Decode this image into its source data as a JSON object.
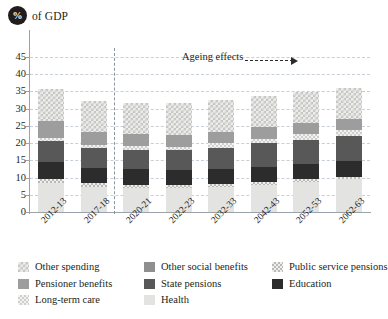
{
  "header": {
    "badge": "%",
    "label": "of GDP"
  },
  "annotation": {
    "ageing_effects": "Ageing effects"
  },
  "legend": {
    "items": [
      {
        "label": "Other spending",
        "key": "other_spending",
        "color": "#ececeb"
      },
      {
        "label": "Other social benefits",
        "key": "other_social",
        "color": "#8f8f8f"
      },
      {
        "label": "Public service pensions",
        "key": "public_service_pensions",
        "color": "#efefee"
      },
      {
        "label": "Pensioner benefits",
        "key": "pensioner_benefits",
        "color": "#9d9d9d"
      },
      {
        "label": "State pensions",
        "key": "state_pensions",
        "color": "#585858"
      },
      {
        "label": "Education",
        "key": "education",
        "color": "#2c2c2c"
      },
      {
        "label": "Long-term care",
        "key": "long_term_care",
        "color": "#f2f2f1"
      },
      {
        "label": "Health",
        "key": "health",
        "color": "#e3e3e1"
      }
    ]
  },
  "chart_data": {
    "type": "bar",
    "stacked": true,
    "title": "",
    "xlabel": "",
    "ylabel": "% of GDP",
    "ylim": [
      0,
      45
    ],
    "yticks": [
      0,
      5,
      10,
      15,
      20,
      25,
      30,
      35,
      40,
      45
    ],
    "grid": true,
    "legend_position": "bottom",
    "categories": [
      "2012-13",
      "2017-18",
      "2020-21",
      "2022-23",
      "2032-33",
      "2042-43",
      "2052-53",
      "2062-63"
    ],
    "series": [
      {
        "name": "Health",
        "values": [
          8.5,
          7.3,
          7.0,
          7.0,
          7.3,
          7.9,
          8.7,
          9.5
        ]
      },
      {
        "name": "Public service pensions",
        "values": [
          1.1,
          1.0,
          0.9,
          0.9,
          0.9,
          0.8,
          0.8,
          0.8
        ]
      },
      {
        "name": "Education",
        "values": [
          5.0,
          4.6,
          4.5,
          4.4,
          4.4,
          4.4,
          4.4,
          4.4
        ]
      },
      {
        "name": "State pensions",
        "values": [
          5.9,
          5.6,
          5.6,
          5.6,
          6.1,
          6.8,
          7.1,
          7.4
        ]
      },
      {
        "name": "Long-term care",
        "values": [
          1.1,
          1.1,
          1.1,
          1.1,
          1.2,
          1.4,
          1.6,
          1.8
        ]
      },
      {
        "name": "Pensioner benefits",
        "values": [
          4.8,
          3.7,
          3.5,
          3.5,
          3.4,
          3.3,
          3.2,
          3.1
        ]
      },
      {
        "name": "Other spending",
        "values": [
          9.4,
          8.9,
          9.0,
          9.1,
          9.2,
          9.2,
          9.0,
          8.9
        ]
      }
    ],
    "totals": [
      40.3,
      36.5,
      36.2,
      36.3,
      37.5,
      39.0,
      39.3,
      40.5
    ],
    "divider_after_category": "2017-18",
    "annotations": [
      {
        "text": "Ageing effects",
        "type": "arrow-right"
      }
    ]
  }
}
